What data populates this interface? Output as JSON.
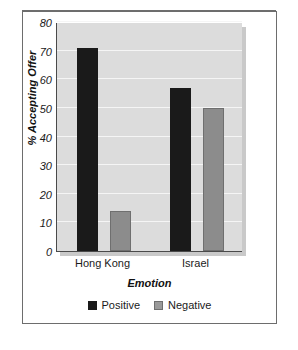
{
  "chart_data": {
    "type": "bar",
    "title": "",
    "subtitle": "",
    "xlabel": "Emotion",
    "ylabel": "% Accepting Offer",
    "categories": [
      "Hong Kong",
      "Israel"
    ],
    "series": [
      {
        "name": "Positive",
        "values": [
          71,
          57
        ],
        "color": "#1a1a1a"
      },
      {
        "name": "Negative",
        "values": [
          14,
          50
        ],
        "color": "#8c8c8c"
      }
    ],
    "ylim": [
      0,
      80
    ],
    "ytick_values": [
      80,
      70,
      60,
      50,
      40,
      30,
      20,
      10,
      0
    ],
    "ytick_labels": [
      "80",
      "70",
      "60",
      "50",
      "40",
      "30",
      "20",
      "10",
      "0"
    ],
    "grid": "horizontal",
    "legend_position": "bottom",
    "plot_background": "#dcdcdc",
    "gridline_color": "#f5f5f5",
    "figure_background": "#ffffff"
  }
}
